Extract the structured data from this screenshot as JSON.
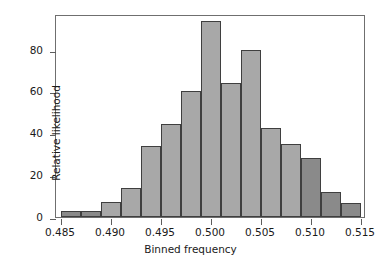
{
  "chart_data": {
    "type": "bar",
    "title": "",
    "xlabel": "Binned frequency",
    "ylabel": "Relative likelihood",
    "xlim": [
      0.4845,
      0.5155
    ],
    "ylim": [
      0,
      97
    ],
    "grid": false,
    "legend": null,
    "bin_width": 0.002,
    "xticks": [
      0.485,
      0.49,
      0.495,
      0.5,
      0.505,
      0.51,
      0.515
    ],
    "xtick_labels": [
      "0.485",
      "0.490",
      "0.495",
      "0.500",
      "0.505",
      "0.510",
      "0.515"
    ],
    "yticks": [
      0,
      20,
      40,
      60,
      80
    ],
    "ytick_labels": [
      "0",
      "20",
      "40",
      "60",
      "80"
    ],
    "bin_left_edges": [
      0.485,
      0.487,
      0.489,
      0.491,
      0.493,
      0.495,
      0.497,
      0.499,
      0.501,
      0.503,
      0.505,
      0.507,
      0.509,
      0.511,
      0.513
    ],
    "bin_centers": [
      0.486,
      0.488,
      0.49,
      0.492,
      0.494,
      0.496,
      0.498,
      0.5,
      0.502,
      0.504,
      0.506,
      0.508,
      0.51,
      0.512,
      0.514
    ],
    "categories": [
      "0.485-0.487",
      "0.487-0.489",
      "0.489-0.491",
      "0.491-0.493",
      "0.493-0.495",
      "0.495-0.497",
      "0.497-0.499",
      "0.499-0.501",
      "0.501-0.503",
      "0.503-0.505",
      "0.505-0.507",
      "0.507-0.509",
      "0.509-0.511",
      "0.511-0.513",
      "0.513-0.515"
    ],
    "values": [
      3,
      3,
      7,
      14,
      34,
      44.5,
      60,
      93.5,
      64,
      80,
      42.5,
      35,
      28,
      12,
      6.5
    ],
    "bar_shades": [
      "dark",
      "dark",
      "light",
      "light",
      "light",
      "light",
      "light",
      "light",
      "light",
      "light",
      "light",
      "light",
      "dark",
      "dark",
      "dark"
    ],
    "colors": {
      "bar_light": "#a8a8a8",
      "bar_dark": "#8a8a8a",
      "bar_edge": "#3f3f3f",
      "frame": "#6f6f6f",
      "text": "#1a1a1a",
      "background": "#ffffff"
    }
  }
}
